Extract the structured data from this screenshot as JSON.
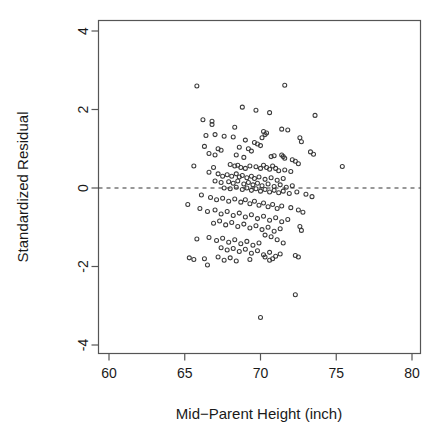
{
  "chart_data": {
    "type": "scatter",
    "title": "",
    "xlabel": "Mid−Parent Height (inch)",
    "ylabel": "Standardized Residual",
    "xlim": [
      59.1,
      79.0
    ],
    "ylim": [
      -4.45,
      4.45
    ],
    "xticks": [
      60,
      65,
      70,
      75,
      80
    ],
    "xticklabels": [
      "60",
      "65",
      "70",
      "75",
      "80"
    ],
    "yticks": [
      4,
      2,
      0,
      -2,
      -4
    ],
    "yticklabels": [
      "4",
      "2",
      "0",
      "-2",
      "-4"
    ],
    "grid": false,
    "legend": null,
    "marker": "open-circle",
    "marker_size": 4,
    "point_color": "#3a3a3a",
    "reference_lines": [
      {
        "orientation": "horizontal",
        "y": 0,
        "style": "dashed",
        "color": "#333333"
      }
    ],
    "n_points": 205,
    "points": [
      [
        65.8,
        2.6
      ],
      [
        71.6,
        2.62
      ],
      [
        69.7,
        1.98
      ],
      [
        68.8,
        2.06
      ],
      [
        70.6,
        1.92
      ],
      [
        73.6,
        1.85
      ],
      [
        66.2,
        1.74
      ],
      [
        66.8,
        1.7
      ],
      [
        66.8,
        1.62
      ],
      [
        68.3,
        1.55
      ],
      [
        71.4,
        1.5
      ],
      [
        71.8,
        1.48
      ],
      [
        70.2,
        1.44
      ],
      [
        70.4,
        1.4
      ],
      [
        66.4,
        1.34
      ],
      [
        67.0,
        1.36
      ],
      [
        67.6,
        1.32
      ],
      [
        68.2,
        1.3
      ],
      [
        70.1,
        1.28
      ],
      [
        70.3,
        1.36
      ],
      [
        72.6,
        1.28
      ],
      [
        72.7,
        1.18
      ],
      [
        69.0,
        1.22
      ],
      [
        69.6,
        1.16
      ],
      [
        69.8,
        1.12
      ],
      [
        70.0,
        1.08
      ],
      [
        66.3,
        1.06
      ],
      [
        67.2,
        1.0
      ],
      [
        67.4,
        0.96
      ],
      [
        68.6,
        1.04
      ],
      [
        69.2,
        1.0
      ],
      [
        69.4,
        0.94
      ],
      [
        73.3,
        0.92
      ],
      [
        73.5,
        0.86
      ],
      [
        66.6,
        0.88
      ],
      [
        67.0,
        0.84
      ],
      [
        68.4,
        0.84
      ],
      [
        68.9,
        0.78
      ],
      [
        70.7,
        0.8
      ],
      [
        70.9,
        0.82
      ],
      [
        71.4,
        0.84
      ],
      [
        71.5,
        0.8
      ],
      [
        71.6,
        0.76
      ],
      [
        72.1,
        0.72
      ],
      [
        72.3,
        0.68
      ],
      [
        72.5,
        0.62
      ],
      [
        65.6,
        0.56
      ],
      [
        66.9,
        0.52
      ],
      [
        75.4,
        0.55
      ],
      [
        68.0,
        0.6
      ],
      [
        68.3,
        0.56
      ],
      [
        68.5,
        0.58
      ],
      [
        68.7,
        0.52
      ],
      [
        69.0,
        0.5
      ],
      [
        69.3,
        0.56
      ],
      [
        69.7,
        0.54
      ],
      [
        70.0,
        0.5
      ],
      [
        70.2,
        0.58
      ],
      [
        70.4,
        0.52
      ],
      [
        70.6,
        0.48
      ],
      [
        70.8,
        0.56
      ],
      [
        71.0,
        0.5
      ],
      [
        71.2,
        0.44
      ],
      [
        71.6,
        0.46
      ],
      [
        72.0,
        0.42
      ],
      [
        66.6,
        0.4
      ],
      [
        67.2,
        0.36
      ],
      [
        67.5,
        0.3
      ],
      [
        67.8,
        0.34
      ],
      [
        68.1,
        0.3
      ],
      [
        68.4,
        0.36
      ],
      [
        68.6,
        0.28
      ],
      [
        68.8,
        0.32
      ],
      [
        69.1,
        0.26
      ],
      [
        69.4,
        0.3
      ],
      [
        69.6,
        0.24
      ],
      [
        69.9,
        0.28
      ],
      [
        70.3,
        0.22
      ],
      [
        70.7,
        0.26
      ],
      [
        71.1,
        0.2
      ],
      [
        71.5,
        0.24
      ],
      [
        67.0,
        0.18
      ],
      [
        67.4,
        0.14
      ],
      [
        67.9,
        0.16
      ],
      [
        68.2,
        0.12
      ],
      [
        68.5,
        0.18
      ],
      [
        68.9,
        0.1
      ],
      [
        69.2,
        0.14
      ],
      [
        69.5,
        0.08
      ],
      [
        69.8,
        0.12
      ],
      [
        70.1,
        0.06
      ],
      [
        70.5,
        0.1
      ],
      [
        70.9,
        0.04
      ],
      [
        71.3,
        0.08
      ],
      [
        71.7,
        0.02
      ],
      [
        72.1,
        0.06
      ],
      [
        67.6,
        0.0
      ],
      [
        68.0,
        -0.02
      ],
      [
        68.4,
        0.02
      ],
      [
        68.8,
        -0.04
      ],
      [
        69.1,
        0.0
      ],
      [
        69.4,
        -0.06
      ],
      [
        69.7,
        -0.02
      ],
      [
        70.0,
        -0.08
      ],
      [
        70.3,
        -0.04
      ],
      [
        70.6,
        -0.1
      ],
      [
        70.9,
        -0.06
      ],
      [
        71.2,
        -0.12
      ],
      [
        71.5,
        -0.08
      ],
      [
        71.9,
        -0.14
      ],
      [
        72.4,
        -0.1
      ],
      [
        73.0,
        -0.16
      ],
      [
        73.4,
        -0.22
      ],
      [
        66.1,
        -0.18
      ],
      [
        66.7,
        -0.24
      ],
      [
        67.1,
        -0.3
      ],
      [
        67.5,
        -0.26
      ],
      [
        67.9,
        -0.34
      ],
      [
        68.3,
        -0.28
      ],
      [
        68.7,
        -0.36
      ],
      [
        69.0,
        -0.3
      ],
      [
        69.3,
        -0.4
      ],
      [
        69.6,
        -0.34
      ],
      [
        69.9,
        -0.44
      ],
      [
        70.2,
        -0.38
      ],
      [
        70.5,
        -0.48
      ],
      [
        70.8,
        -0.42
      ],
      [
        71.1,
        -0.52
      ],
      [
        71.4,
        -0.46
      ],
      [
        72.0,
        -0.5
      ],
      [
        72.5,
        -0.56
      ],
      [
        72.8,
        -0.62
      ],
      [
        65.2,
        -0.42
      ],
      [
        66.0,
        -0.52
      ],
      [
        66.5,
        -0.6
      ],
      [
        67.0,
        -0.56
      ],
      [
        67.4,
        -0.66
      ],
      [
        67.8,
        -0.6
      ],
      [
        68.2,
        -0.7
      ],
      [
        68.6,
        -0.64
      ],
      [
        69.0,
        -0.74
      ],
      [
        69.4,
        -0.68
      ],
      [
        69.8,
        -0.78
      ],
      [
        70.2,
        -0.72
      ],
      [
        70.6,
        -0.82
      ],
      [
        71.0,
        -0.76
      ],
      [
        71.4,
        -0.86
      ],
      [
        71.8,
        -0.8
      ],
      [
        66.9,
        -0.9
      ],
      [
        67.3,
        -0.84
      ],
      [
        67.7,
        -0.94
      ],
      [
        68.1,
        -0.88
      ],
      [
        68.5,
        -0.98
      ],
      [
        68.9,
        -0.92
      ],
      [
        69.3,
        -1.02
      ],
      [
        69.7,
        -0.96
      ],
      [
        70.1,
        -1.06
      ],
      [
        70.5,
        -1.0
      ],
      [
        70.9,
        -1.1
      ],
      [
        71.3,
        -1.04
      ],
      [
        72.6,
        -0.98
      ],
      [
        72.7,
        -1.08
      ],
      [
        65.8,
        -1.3
      ],
      [
        66.6,
        -1.26
      ],
      [
        67.1,
        -1.34
      ],
      [
        67.5,
        -1.28
      ],
      [
        67.9,
        -1.38
      ],
      [
        68.3,
        -1.32
      ],
      [
        68.7,
        -1.42
      ],
      [
        69.1,
        -1.36
      ],
      [
        69.5,
        -1.46
      ],
      [
        69.9,
        -1.4
      ],
      [
        70.3,
        -1.2
      ],
      [
        70.7,
        -1.24
      ],
      [
        71.1,
        -1.32
      ],
      [
        71.5,
        -1.4
      ],
      [
        67.4,
        -1.52
      ],
      [
        67.8,
        -1.58
      ],
      [
        68.2,
        -1.54
      ],
      [
        68.6,
        -1.62
      ],
      [
        69.0,
        -1.56
      ],
      [
        69.4,
        -1.66
      ],
      [
        69.8,
        -1.6
      ],
      [
        70.2,
        -1.7
      ],
      [
        70.6,
        -1.64
      ],
      [
        71.0,
        -1.74
      ],
      [
        71.3,
        -1.68
      ],
      [
        65.3,
        -1.78
      ],
      [
        65.6,
        -1.82
      ],
      [
        66.3,
        -1.8
      ],
      [
        67.2,
        -1.76
      ],
      [
        67.6,
        -1.84
      ],
      [
        68.0,
        -1.78
      ],
      [
        68.4,
        -1.86
      ],
      [
        69.3,
        -1.82
      ],
      [
        70.3,
        -1.76
      ],
      [
        70.6,
        -1.84
      ],
      [
        70.8,
        -1.8
      ],
      [
        72.3,
        -1.72
      ],
      [
        72.5,
        -1.76
      ],
      [
        66.5,
        -1.96
      ],
      [
        72.3,
        -2.72
      ],
      [
        70.0,
        -3.3
      ]
    ]
  },
  "axis": {
    "x_title": "Mid−Parent Height (inch)",
    "y_title": "Standardized Residual"
  }
}
